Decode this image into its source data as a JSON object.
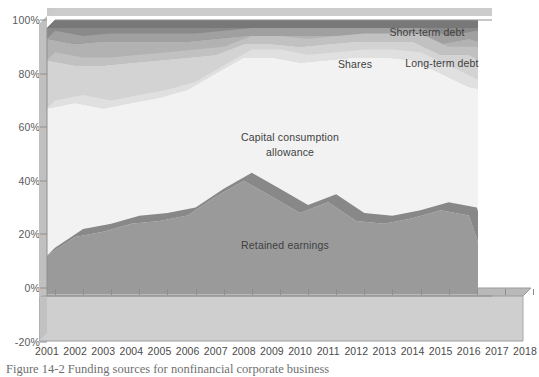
{
  "chart_data": {
    "type": "area",
    "stacked": true,
    "title": "",
    "xlabel": "",
    "ylabel": "",
    "ylim": [
      -20,
      100
    ],
    "yticks": [
      "-20%",
      "0%",
      "20%",
      "40%",
      "60%",
      "80%",
      "100%"
    ],
    "ytick_values": [
      -20,
      0,
      20,
      40,
      60,
      80,
      100
    ],
    "grid": false,
    "legend_position": "in-plot-annotations",
    "categories": [
      "2001",
      "2002",
      "2003",
      "2004",
      "2005",
      "2006",
      "2007",
      "2008",
      "2009",
      "2010",
      "2011",
      "2012",
      "2013",
      "2014",
      "2015",
      "2016",
      "2017",
      "2018"
    ],
    "series": [
      {
        "name": "Retained earnings",
        "color": "#9a9a9a",
        "values": [
          15,
          22,
          24,
          27,
          28,
          30,
          37,
          43,
          37,
          31,
          35,
          28,
          27,
          29,
          32,
          30,
          0,
          21
        ]
      },
      {
        "name": "Capital consumption allowance",
        "color": "#f2f2f2",
        "values": [
          55,
          50,
          46,
          45,
          46,
          47,
          46,
          46,
          52,
          56,
          53,
          61,
          62,
          59,
          51,
          48,
          76,
          55
        ]
      },
      {
        "name": "Shares",
        "color": "#d3d3d3",
        "values": [
          18,
          14,
          16,
          15,
          14,
          12,
          7,
          5,
          5,
          6,
          6,
          6,
          6,
          7,
          7,
          12,
          9,
          15
        ]
      },
      {
        "name": "Long-term debt",
        "color": "#b2b2b2",
        "values": [
          8,
          8,
          9,
          8,
          7,
          6,
          6,
          3,
          3,
          4,
          3,
          2,
          2,
          2,
          4,
          6,
          8,
          5
        ]
      },
      {
        "name": "Short-term debt",
        "color": "#8a8a8a",
        "values": [
          4,
          6,
          5,
          5,
          5,
          5,
          4,
          3,
          3,
          3,
          3,
          3,
          3,
          3,
          6,
          4,
          7,
          4
        ]
      }
    ],
    "annotations": [
      {
        "text": "Short-term debt",
        "x_px": 427,
        "y_px": 26,
        "align": "center"
      },
      {
        "text": "Shares",
        "x_px": 355,
        "y_px": 58,
        "align": "center"
      },
      {
        "text": "Long-term debt",
        "x_px": 442,
        "y_px": 57,
        "align": "center"
      },
      {
        "text": "Capital consumption",
        "x_px": 290,
        "y_px": 131,
        "align": "center"
      },
      {
        "text": "allowance",
        "x_px": 290,
        "y_px": 146,
        "align": "center"
      },
      {
        "text": "Retained earnings",
        "x_px": 285,
        "y_px": 239,
        "align": "center"
      }
    ]
  },
  "caption": {
    "text": "Figure 14-2  Funding sources for nonfinancial corporate business"
  },
  "colors": {
    "retained_earnings": "#9a9a9a",
    "capital_consumption_allowance": "#f2f2f2",
    "shares": "#d3d3d3",
    "long_term_debt": "#b2b2b2",
    "short_term_debt": "#8a8a8a",
    "floor": "#c9c9c9",
    "wall": "#c4c4c4",
    "axis": "#8d8d8d",
    "text": "#4a4a4a"
  }
}
